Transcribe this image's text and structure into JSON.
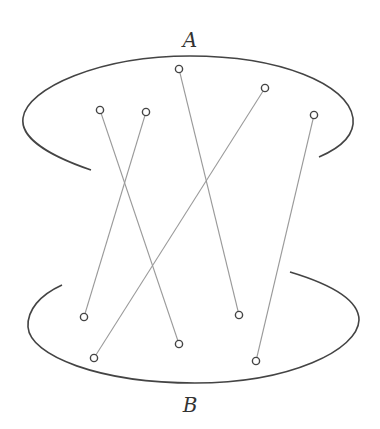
{
  "diagram": {
    "type": "bipartite-matching",
    "colors": {
      "boundary": "#444444",
      "edge": "#9a9a9a",
      "node_stroke": "#444444",
      "node_fill": "#ffffff",
      "label": "#333333"
    },
    "sets": [
      {
        "id": "A",
        "label": "A",
        "label_pos": [
          190,
          47
        ]
      },
      {
        "id": "B",
        "label": "B",
        "label_pos": [
          190,
          412
        ]
      }
    ],
    "nodes_A": [
      {
        "id": "a1",
        "x": 100,
        "y": 110
      },
      {
        "id": "a2",
        "x": 146,
        "y": 112
      },
      {
        "id": "a3",
        "x": 179,
        "y": 69
      },
      {
        "id": "a4",
        "x": 265,
        "y": 88
      },
      {
        "id": "a5",
        "x": 314,
        "y": 115
      }
    ],
    "nodes_B": [
      {
        "id": "b1",
        "x": 84,
        "y": 317
      },
      {
        "id": "b2",
        "x": 94,
        "y": 358
      },
      {
        "id": "b3",
        "x": 179,
        "y": 344
      },
      {
        "id": "b4",
        "x": 239,
        "y": 315
      },
      {
        "id": "b5",
        "x": 256,
        "y": 361
      }
    ],
    "edges": [
      {
        "from": "a1",
        "to": "b3"
      },
      {
        "from": "a2",
        "to": "b1"
      },
      {
        "from": "a3",
        "to": "b4"
      },
      {
        "from": "a4",
        "to": "b2"
      },
      {
        "from": "a5",
        "to": "b5"
      }
    ]
  }
}
